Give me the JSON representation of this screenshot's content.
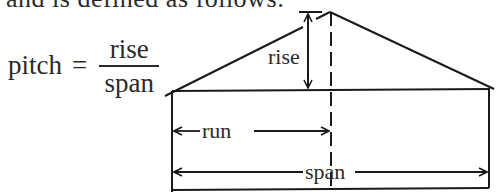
{
  "intro_text": "and is defined as follows:",
  "formula": {
    "lhs": "pitch",
    "equals": "=",
    "numerator": "rise",
    "denominator": "span"
  },
  "diagram": {
    "labels": {
      "rise": "rise",
      "run": "run",
      "span": "span"
    },
    "colors": {
      "line": "#1a1a1a",
      "text": "#2a2a2a",
      "background": "#ffffff"
    }
  }
}
